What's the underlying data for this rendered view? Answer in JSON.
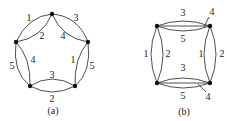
{
  "figure": {
    "panels": [
      {
        "caption": "(a)",
        "description": "pentagon multigraph with 5 vertices, each adjacent pair joined by two curved edges",
        "vertices": [
          "top",
          "right",
          "bottom-right",
          "bottom-left",
          "left"
        ],
        "edge_labels": {
          "top_left_outer": "1",
          "top_left_inner": "2",
          "top_right_outer": "3",
          "top_right_inner": "4",
          "right_inner": "1",
          "right_outer": "5",
          "bottom_inner": "3",
          "bottom_outer": "2",
          "left_inner": "4",
          "left_outer": "5"
        }
      },
      {
        "caption": "(b)",
        "description": "square multigraph with 4 vertices; top and bottom sides have three edges, left and right sides have two",
        "vertices": [
          "top-left",
          "top-right",
          "bottom-right",
          "bottom-left"
        ],
        "edge_labels": {
          "top_outer": "3",
          "top_middle": "4",
          "top_inner": "5",
          "left_outer": "1",
          "left_inner": "2",
          "right_inner": "1",
          "right_outer": "2",
          "bottom_inner": "3",
          "bottom_middle": "4",
          "bottom_outer": "5"
        }
      }
    ]
  }
}
